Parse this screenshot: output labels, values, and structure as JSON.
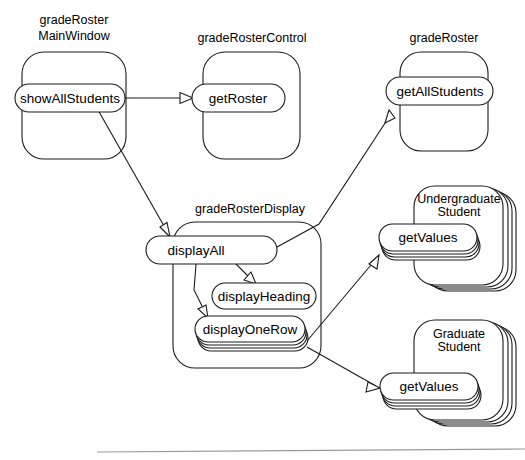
{
  "diagram": {
    "type": "uml-collaboration-diagram",
    "title": "",
    "background_color": "#ffffff",
    "line_color": "#1a1a1a",
    "rule_color": "#9a9a9a"
  },
  "objects": [
    {
      "id": "grade-roster-main-window",
      "label_lines": [
        "gradeRoster",
        "MainWindow"
      ],
      "stacked": false,
      "operations": [
        {
          "id": "show-all-students",
          "label": "showAllStudents",
          "stacked": false
        }
      ]
    },
    {
      "id": "grade-roster-control",
      "label_lines": [
        "gradeRosterControl"
      ],
      "stacked": false,
      "operations": [
        {
          "id": "get-roster",
          "label": "getRoster",
          "stacked": false
        }
      ]
    },
    {
      "id": "grade-roster",
      "label_lines": [
        "gradeRoster"
      ],
      "stacked": false,
      "operations": [
        {
          "id": "get-all-students",
          "label": "getAllStudents",
          "stacked": false
        }
      ]
    },
    {
      "id": "grade-roster-display",
      "label_lines": [
        "gradeRosterDisplay"
      ],
      "stacked": false,
      "operations": [
        {
          "id": "display-all",
          "label": "displayAll",
          "stacked": false
        },
        {
          "id": "display-heading",
          "label": "displayHeading",
          "stacked": false
        },
        {
          "id": "display-one-row",
          "label": "displayOneRow",
          "stacked": true
        }
      ]
    },
    {
      "id": "undergraduate-student",
      "label_lines": [
        "Undergraduate",
        "Student"
      ],
      "stacked": true,
      "operations": [
        {
          "id": "get-values-undergraduate",
          "label": "getValues",
          "stacked": true
        }
      ]
    },
    {
      "id": "graduate-student",
      "label_lines": [
        "Graduate",
        "Student"
      ],
      "stacked": true,
      "operations": [
        {
          "id": "get-values-graduate",
          "label": "getValues",
          "stacked": true
        }
      ]
    }
  ],
  "messages": [
    {
      "id": "msg-show-all-students-to-get-roster",
      "from": "show-all-students",
      "to": "get-roster",
      "arrow": "open-triangle"
    },
    {
      "id": "msg-show-all-students-to-display-all",
      "from": "show-all-students",
      "to": "display-all",
      "arrow": "open-triangle"
    },
    {
      "id": "msg-display-all-to-get-all-students",
      "from": "display-all",
      "to": "get-all-students",
      "arrow": "open-triangle"
    },
    {
      "id": "msg-display-all-to-display-heading",
      "from": "display-all",
      "to": "display-heading",
      "arrow": "open-triangle"
    },
    {
      "id": "msg-display-all-to-display-one-row",
      "from": "display-all",
      "to": "display-one-row",
      "arrow": "open-triangle"
    },
    {
      "id": "msg-display-one-row-to-get-values-undergraduate",
      "from": "display-one-row",
      "to": "get-values-undergraduate",
      "arrow": "open-triangle"
    },
    {
      "id": "msg-display-one-row-to-get-values-graduate",
      "from": "display-one-row",
      "to": "get-values-graduate",
      "arrow": "open-triangle"
    }
  ],
  "labels": {
    "grade_roster_main_window_line1": "gradeRoster",
    "grade_roster_main_window_line2": "MainWindow",
    "grade_roster_control": "gradeRosterControl",
    "grade_roster": "gradeRoster",
    "grade_roster_display": "gradeRosterDisplay",
    "undergraduate_student_line1": "Undergraduate",
    "undergraduate_student_line2": "Student",
    "graduate_student_line1": "Graduate",
    "graduate_student_line2": "Student",
    "show_all_students": "showAllStudents",
    "get_roster": "getRoster",
    "get_all_students": "getAllStudents",
    "display_all": "displayAll",
    "display_heading": "displayHeading",
    "display_one_row": "displayOneRow",
    "get_values_undergraduate": "getValues",
    "get_values_graduate": "getValues"
  }
}
